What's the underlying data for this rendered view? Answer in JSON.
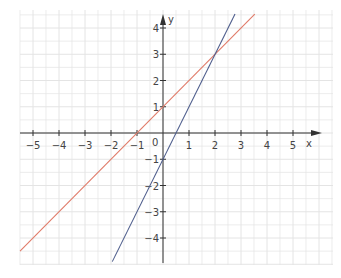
{
  "chart_data": {
    "type": "line",
    "title": "",
    "xlabel": "x",
    "ylabel": "y",
    "xlim": [
      -5.5,
      6.6
    ],
    "ylim": [
      -4.9,
      4.7
    ],
    "grid": true,
    "grid_minor_step": 0.5,
    "x_ticks": [
      -5,
      -4,
      -3,
      -2,
      -1,
      1,
      2,
      3,
      4,
      5
    ],
    "x_tick_labels": [
      "−5",
      "−4",
      "−3",
      "−2",
      "−1",
      "1",
      "2",
      "3",
      "4",
      "5"
    ],
    "y_ticks": [
      -4,
      -3,
      -2,
      -1,
      1,
      2,
      3,
      4
    ],
    "y_tick_labels": [
      "−4",
      "−3",
      "−2",
      "−1",
      "1",
      "2",
      "3",
      "4"
    ],
    "origin_label": "0",
    "series": [
      {
        "name": "y = x + 1",
        "color": "#e07a68",
        "slope": 1,
        "intercept": 1,
        "x": [
          -5.5,
          3.53
        ],
        "y": [
          -4.5,
          4.53
        ]
      },
      {
        "name": "y = 2x − 1",
        "color": "#4e5d8c",
        "slope": 2,
        "intercept": -1,
        "x": [
          -1.95,
          2.77
        ],
        "y": [
          -4.9,
          4.53
        ]
      }
    ],
    "intersection": {
      "x": 2,
      "y": 3
    }
  },
  "colors": {
    "grid": "#e4e4e4",
    "axis": "#333333",
    "background": "#ffffff"
  }
}
